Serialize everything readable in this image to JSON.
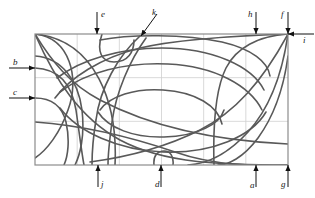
{
  "figure": {
    "name": "geometric-curve-diagram",
    "background": "#ffffff",
    "frame": {
      "x": 35,
      "y": 34,
      "width": 253,
      "height": 131,
      "stroke": "#8c8c8c",
      "stroke_width": 1.2
    },
    "grid": {
      "columns": 6,
      "rows": 3,
      "stroke": "#cfcfcf",
      "stroke_width": 0.8,
      "visible": true
    },
    "curve_style": {
      "stroke": "#595959",
      "stroke_width": 1.6,
      "fill": "none"
    },
    "arrow_style": {
      "stroke": "#111111",
      "stroke_width": 1.0,
      "head": "solid-triangle"
    }
  },
  "callouts": [
    {
      "id": "b",
      "label": "b",
      "direction": "right",
      "side": "left",
      "label_x": 13,
      "label_y": 58,
      "tip_x": 35,
      "tip_y": 68,
      "tail_x": 9,
      "tail_y": 68
    },
    {
      "id": "c",
      "label": "c",
      "direction": "right",
      "side": "left",
      "label_x": 13,
      "label_y": 88,
      "tip_x": 35,
      "tip_y": 98,
      "tail_x": 9,
      "tail_y": 98
    },
    {
      "id": "e",
      "label": "e",
      "direction": "down",
      "side": "top",
      "label_x": 101,
      "label_y": 10,
      "tip_x": 97,
      "tip_y": 34,
      "tail_x": 97,
      "tail_y": 12
    },
    {
      "id": "k",
      "label": "k",
      "direction": "up-right",
      "side": "top",
      "label_x": 152,
      "label_y": 8,
      "tip_x": 141,
      "tip_y": 36,
      "tail_x": 157,
      "tail_y": 14
    },
    {
      "id": "h",
      "label": "h",
      "direction": "down",
      "side": "top",
      "label_x": 248,
      "label_y": 10,
      "tip_x": 256,
      "tip_y": 34,
      "tail_x": 256,
      "tail_y": 12
    },
    {
      "id": "f",
      "label": "f",
      "direction": "down",
      "side": "top",
      "label_x": 281,
      "label_y": 10,
      "tip_x": 288,
      "tip_y": 34,
      "tail_x": 288,
      "tail_y": 12
    },
    {
      "id": "i",
      "label": "i",
      "direction": "left",
      "side": "right",
      "label_x": 303,
      "label_y": 36,
      "tip_x": 288,
      "tip_y": 34,
      "tail_x": 314,
      "tail_y": 34
    },
    {
      "id": "j",
      "label": "j",
      "direction": "up",
      "side": "bottom",
      "label_x": 101,
      "label_y": 180,
      "tip_x": 98,
      "tip_y": 165,
      "tail_x": 98,
      "tail_y": 187
    },
    {
      "id": "d",
      "label": "d",
      "direction": "up",
      "side": "bottom",
      "label_x": 155,
      "label_y": 180,
      "tip_x": 161,
      "tip_y": 165,
      "tail_x": 161,
      "tail_y": 187
    },
    {
      "id": "a",
      "label": "a",
      "direction": "up",
      "side": "bottom",
      "label_x": 250,
      "label_y": 181,
      "tip_x": 256,
      "tip_y": 165,
      "tail_x": 256,
      "tail_y": 187
    },
    {
      "id": "g",
      "label": "g",
      "direction": "up",
      "side": "bottom",
      "label_x": 281,
      "label_y": 180,
      "tip_x": 288,
      "tip_y": 165,
      "tail_x": 288,
      "tail_y": 187
    }
  ],
  "curves": [
    {
      "id": "curve-1",
      "d": "M 35 34 C 96 40 118 104 115 165"
    },
    {
      "id": "curve-2",
      "d": "M 35 34 C 70 38 80 78 68 110 C 60 133 47 150 35 158"
    },
    {
      "id": "curve-3",
      "d": "M 35 56 C 62 58 78 80 82 110 C 85 136 80 155 75 165"
    },
    {
      "id": "curve-4",
      "d": "M 35 68 C 60 69 72 86 76 110 C 80 138 82 155 84 165"
    },
    {
      "id": "curve-5",
      "d": "M 35 98 C 52 98 62 106 66 122 C 70 140 68 156 64 165"
    },
    {
      "id": "curve-6",
      "d": "M 35 34 C 52 62 70 84 100 100 C 142 122 200 140 288 144"
    },
    {
      "id": "curve-7",
      "d": "M 35 34 C 55 80 80 118 120 140 C 165 164 225 165 288 165"
    },
    {
      "id": "curve-8",
      "d": "M 35 122 C 90 126 140 140 175 152 C 215 166 255 166 288 165"
    },
    {
      "id": "curve-9",
      "d": "M 288 34 C 230 36 175 40 140 48 C 100 58 70 78 55 98"
    },
    {
      "id": "curve-10",
      "d": "M 288 34 C 262 82 235 112 200 130 C 160 150 120 158 90 162"
    },
    {
      "id": "curve-11",
      "d": "M 288 34 C 282 76 268 110 248 132 C 226 156 205 164 188 165"
    },
    {
      "id": "curve-12",
      "d": "M 288 56 C 284 86 274 116 258 138 C 243 158 228 165 218 165"
    },
    {
      "id": "curve-13",
      "d": "M 288 34 C 258 36 236 48 226 68 C 214 92 213 130 214 165"
    },
    {
      "id": "curve-14",
      "d": "M 102 34 C 96 52 102 62 114 62 C 128 62 134 52 134 40"
    },
    {
      "id": "curve-15",
      "d": "M 154 165 C 153 155 158 151 164 151 C 170 151 174 156 173 165"
    },
    {
      "id": "curve-16",
      "d": "M 100 40 C 130 34 185 34 222 42 C 252 49 268 62 270 76"
    },
    {
      "id": "curve-17",
      "d": "M 57 78 C 80 60 120 48 162 48 C 212 48 252 66 264 90"
    },
    {
      "id": "curve-18",
      "d": "M 60 92 C 86 72 126 62 168 64 C 215 66 250 86 262 110"
    },
    {
      "id": "curve-19",
      "d": "M 100 110 C 110 96 135 88 163 90 C 196 92 218 106 222 124"
    },
    {
      "id": "curve-20",
      "d": "M 98 112 C 108 128 134 138 164 137 C 198 136 220 124 224 110"
    },
    {
      "id": "curve-21",
      "d": "M 60 108 C 78 132 118 150 163 152 C 212 154 252 136 266 112"
    },
    {
      "id": "curve-22",
      "d": "M 140 36 C 118 56 100 88 96 120 C 92 144 92 158 92 165"
    },
    {
      "id": "curve-23",
      "d": "M 146 38 C 130 60 116 92 112 122 C 109 144 108 158 108 165"
    }
  ],
  "meta": {
    "title": "",
    "stroke_color_curves": "#595959",
    "stroke_color_frame": "#8c8c8c",
    "stroke_color_grid": "#cfcfcf",
    "label_color": "#1a1a1a"
  }
}
